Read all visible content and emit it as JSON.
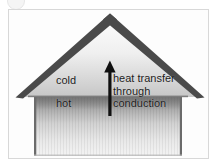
{
  "figure": {
    "background_color": "#ffffff",
    "frame_color": "#d8d8d8"
  },
  "diagram": {
    "house": {
      "roof": {
        "name": "gable-roof",
        "edge_color": "#4a4a4a",
        "fill_top_color": "#fbfbfb",
        "fill_bottom_color": "#c9c9c9",
        "peak": {
          "x": 110,
          "y": 15
        },
        "left_eave": {
          "x": 17,
          "y": 98
        },
        "right_eave": {
          "x": 202,
          "y": 98
        }
      },
      "wall": {
        "name": "house-wall",
        "edge_color": "#6f6f6f",
        "fill_top_color": "#8f8f8f",
        "fill_bottom_color": "#f2f2f2",
        "left": 34,
        "right": 182,
        "top": 97,
        "bottom": 156
      },
      "ceiling_line_color": "#7d7d7d"
    },
    "arrow": {
      "name": "heat-flow-arrow",
      "direction": "up",
      "color": "#101010",
      "x": 110,
      "tail_y": 116,
      "head_y": 61
    },
    "labels": {
      "cold": "cold",
      "hot": "hot",
      "caption_lines": [
        "heat transfer",
        "through",
        "conduction"
      ],
      "text_color": "#1b1b1b"
    }
  }
}
